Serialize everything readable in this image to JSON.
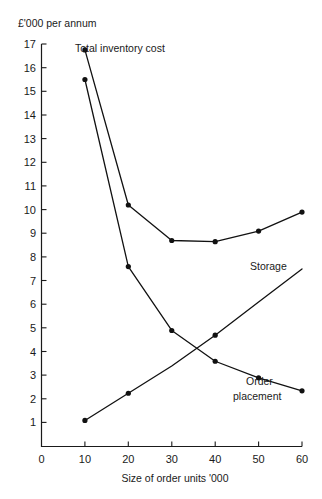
{
  "chart_data": {
    "type": "line",
    "title": "",
    "ylabel": "£'000 per annum",
    "xlabel": "Size of order units '000",
    "x": [
      10,
      20,
      30,
      40,
      50,
      60
    ],
    "xlim": [
      0,
      60
    ],
    "ylim": [
      0,
      17
    ],
    "grid": false,
    "legend_position": "inline-annotations",
    "xticks": [
      "0",
      "10",
      "20",
      "30",
      "40",
      "50",
      "60"
    ],
    "yticks": [
      "1",
      "2",
      "3",
      "4",
      "5",
      "6",
      "7",
      "8",
      "9",
      "10",
      "11",
      "12",
      "13",
      "14",
      "15",
      "16",
      "17"
    ],
    "series": [
      {
        "name": "Total inventory cost",
        "label": "Total inventory cost",
        "markers": true,
        "values": [
          16.75,
          10.2,
          8.7,
          8.65,
          9.1,
          9.9
        ]
      },
      {
        "name": "Order placement",
        "label": "Order placement",
        "markers": true,
        "values": [
          15.5,
          7.6,
          4.9,
          3.6,
          2.9,
          2.35
        ]
      },
      {
        "name": "Storage",
        "label": "Storage",
        "markers": true,
        "values": [
          1.1,
          2.25,
          3.4,
          4.7,
          6.1,
          7.5
        ],
        "marker_points": [
          10,
          20,
          40
        ]
      }
    ],
    "annotations": [
      {
        "name": "total-inventory-cost-label",
        "text": "Total inventory cost",
        "x": 10,
        "y": 16.75
      },
      {
        "name": "storage-label",
        "text": "Storage",
        "x": 52,
        "y": 7.0
      },
      {
        "name": "order-placement-label-line1",
        "text": "Order",
        "x": 50,
        "y": 3.0
      },
      {
        "name": "order-placement-label-line2",
        "text": "placement",
        "x": 50,
        "y": 2.4
      }
    ]
  },
  "axes": {
    "y_axis_title": "£'000 per annum",
    "x_axis_title": "Size of order units '000"
  },
  "labels": {
    "total_inventory_cost": "Total inventory cost",
    "storage": "Storage",
    "order_placement_line1": "Order",
    "order_placement_line2": "placement"
  },
  "ticks": {
    "x": [
      "0",
      "10",
      "20",
      "30",
      "40",
      "50",
      "60"
    ],
    "y": [
      "1",
      "2",
      "3",
      "4",
      "5",
      "6",
      "7",
      "8",
      "9",
      "10",
      "11",
      "12",
      "13",
      "14",
      "15",
      "16",
      "17"
    ]
  },
  "colors": {
    "ink": "#111111",
    "background": "#ffffff"
  }
}
